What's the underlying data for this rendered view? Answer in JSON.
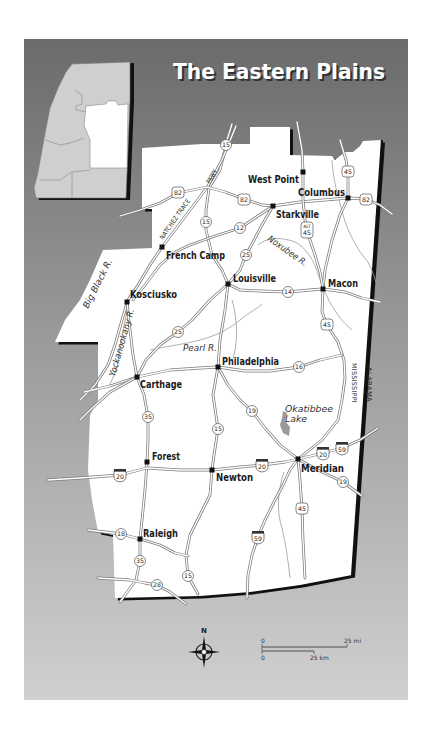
{
  "title": "The Eastern Plains",
  "colors": {
    "background_top": "#6b6b6b",
    "background_bottom": "#cfcfcf",
    "region_fill": "#ffffff",
    "inset_state_fill": "#cfcfcf",
    "border": "#111111"
  },
  "cities": [
    {
      "name": "West Point"
    },
    {
      "name": "Columbus"
    },
    {
      "name": "Starkville"
    },
    {
      "name": "French Camp"
    },
    {
      "name": "Louisville"
    },
    {
      "name": "Macon"
    },
    {
      "name": "Kosciusko"
    },
    {
      "name": "Carthage"
    },
    {
      "name": "Philadelphia"
    },
    {
      "name": "Forest"
    },
    {
      "name": "Newton"
    },
    {
      "name": "Meridian"
    },
    {
      "name": "Raleigh"
    }
  ],
  "routes": [
    {
      "number": "15",
      "type": "state"
    },
    {
      "number": "82",
      "type": "us"
    },
    {
      "number": "82",
      "type": "us"
    },
    {
      "number": "82",
      "type": "us"
    },
    {
      "number": "45",
      "type": "us"
    },
    {
      "number": "15",
      "type": "state"
    },
    {
      "number": "12",
      "type": "state"
    },
    {
      "number": "45",
      "type": "us",
      "prefix": "ALT"
    },
    {
      "number": "25",
      "type": "state"
    },
    {
      "number": "14",
      "type": "state"
    },
    {
      "number": "25",
      "type": "state"
    },
    {
      "number": "35",
      "type": "state"
    },
    {
      "number": "15",
      "type": "state"
    },
    {
      "number": "16",
      "type": "state"
    },
    {
      "number": "19",
      "type": "state"
    },
    {
      "number": "45",
      "type": "us"
    },
    {
      "number": "20",
      "type": "interstate"
    },
    {
      "number": "20",
      "type": "interstate"
    },
    {
      "number": "20",
      "type": "interstate"
    },
    {
      "number": "59",
      "type": "interstate"
    },
    {
      "number": "19",
      "type": "state"
    },
    {
      "number": "45",
      "type": "us"
    },
    {
      "number": "18",
      "type": "state"
    },
    {
      "number": "59",
      "type": "interstate"
    },
    {
      "number": "35",
      "type": "state"
    },
    {
      "number": "15",
      "type": "state"
    },
    {
      "number": "28",
      "type": "state"
    }
  ],
  "water_labels": {
    "big_black": "Big Black R.",
    "yockanookany": "Yockanookany R.",
    "pearl": "Pearl R.",
    "noxubee": "Noxubee R.",
    "lake_line1": "Okatibbee",
    "lake_line2": "Lake"
  },
  "parkway": {
    "line1": "NATCHEZ TRACE",
    "line2": "PKWY"
  },
  "states": {
    "west": "MISSISSIPPI",
    "east": "ALABAMA"
  },
  "compass": {
    "north": "N"
  },
  "scale": {
    "mi_start": "0",
    "mi_end": "25 mi",
    "km_start": "0",
    "km_end": "25 km"
  }
}
